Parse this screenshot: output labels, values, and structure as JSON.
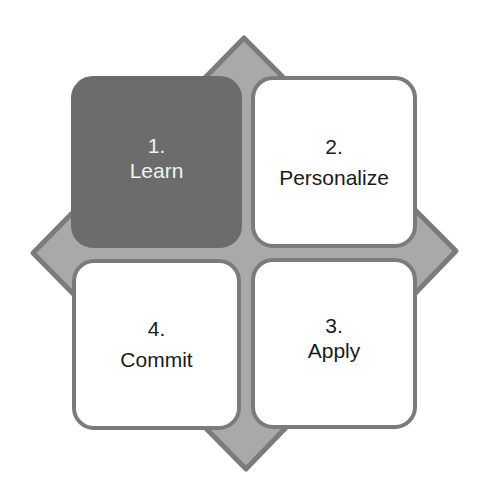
{
  "diagram": {
    "type": "four-step cycle",
    "colors": {
      "diamond_fill": "#a9a9a9",
      "diamond_border": "#7b7b7b",
      "box_fill": "#ffffff",
      "box_border": "#7b7b7b",
      "highlight_fill": "#6c6c6c",
      "highlight_text": "#f2f2f2",
      "text": "#1a1a1a"
    },
    "steps": [
      {
        "number": "1.",
        "label": "Learn",
        "highlighted": true
      },
      {
        "number": "2.",
        "label": "Personalize",
        "highlighted": false
      },
      {
        "number": "3.",
        "label": "Apply",
        "highlighted": false
      },
      {
        "number": "4.",
        "label": "Commit",
        "highlighted": false
      }
    ]
  }
}
